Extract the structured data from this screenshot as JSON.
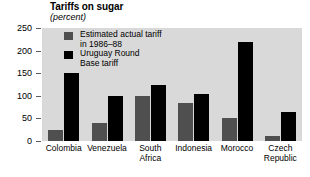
{
  "chart_data": {
    "type": "bar",
    "title": "Tariffs on sugar",
    "subtitle": "(percent)",
    "xlabel": "",
    "ylabel": "",
    "unit": "percent",
    "categories": [
      "Colombia",
      "Venezuela",
      "South Africa",
      "Indonesia",
      "Morocco",
      "Czech Republic"
    ],
    "category_lines": [
      [
        "Colombia"
      ],
      [
        "Venezuela"
      ],
      [
        "South",
        "Africa"
      ],
      [
        "Indonesia"
      ],
      [
        "Morocco"
      ],
      [
        "Czech",
        "Republic"
      ]
    ],
    "series": [
      {
        "name": "Estimated actual tariff in 1986-88",
        "name_lines": [
          "Estimated actual tariff",
          "in 1986–88"
        ],
        "color": "#4f4f4f",
        "values": [
          25,
          40,
          100,
          85,
          50,
          10
        ]
      },
      {
        "name": "Uruguay Round Base tariff",
        "name_lines": [
          "Uruguay Round",
          "Base tariff"
        ],
        "color": "#000000",
        "values": [
          150,
          100,
          125,
          105,
          220,
          65
        ]
      }
    ],
    "yticks": [
      0,
      50,
      100,
      150,
      200,
      250
    ],
    "ylim": [
      0,
      250
    ],
    "grid": false,
    "legend_position": "inside-top-left",
    "plot_background": "#d9d9d9"
  }
}
